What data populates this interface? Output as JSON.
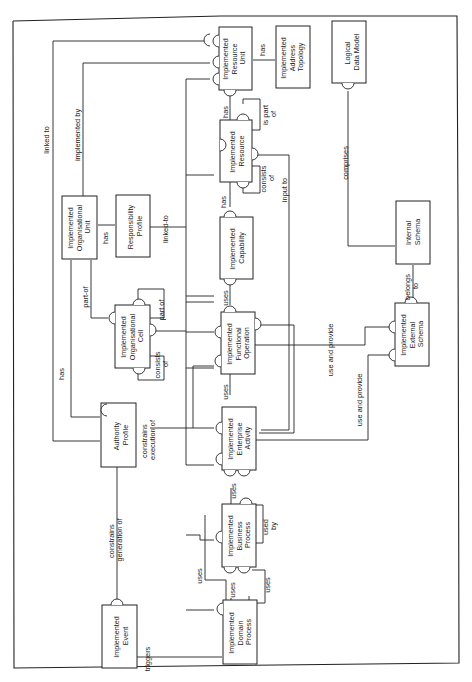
{
  "diagram": {
    "orientation": "rotated 90 degrees counter-clockwise",
    "entities": {
      "resource_unit": [
        "Implemented",
        "Resource",
        "Unit"
      ],
      "address_topology": [
        "Implemented",
        "Address",
        "Topology"
      ],
      "logical_data_model": [
        "Logical",
        "Data Model"
      ],
      "resource": [
        "Implemented",
        "Resource"
      ],
      "capability": [
        "Implemented",
        "Capability"
      ],
      "functional_operation": [
        "Implemented",
        "Functional",
        "Operation"
      ],
      "enterprise_activity": [
        "Implemented",
        "Enterprise",
        "Activity"
      ],
      "business_process": [
        "Implemented",
        "Business",
        "Process"
      ],
      "domain_process": [
        "Implemented",
        "Domain",
        "Process"
      ],
      "org_unit": [
        "Implemented",
        "Organisational",
        "Unit"
      ],
      "responsibility_profile": [
        "Responsibility",
        "Profile"
      ],
      "org_cell": [
        "Implemented",
        "Organisational",
        "Cell"
      ],
      "authority_profile": [
        "Authority",
        "Profile"
      ],
      "event": [
        "Implemented",
        "Event"
      ],
      "internal_schema": [
        "Internal",
        "Schema"
      ],
      "external_schema": [
        "Implemented",
        "External",
        "Schema"
      ]
    },
    "relationships": {
      "linked_to": "linked to",
      "implemented_by": "implemented by",
      "has_resource_unit": "has",
      "has_resource": "has",
      "has_capability": "has",
      "has_responsibility": "has",
      "has_authority": "has",
      "is_part_of": [
        "is part",
        "of"
      ],
      "consists_of_resource": [
        "consists",
        "of"
      ],
      "input_to": "input to",
      "comprises": "comprises",
      "linked_to_responsibility": "linked-to",
      "part_of_unit": "part-of",
      "part_of_cell": "part of",
      "consists_of_cell": [
        "consists",
        "of"
      ],
      "uses_capability": "uses",
      "uses_functional": "uses",
      "uses_enterprise": "uses",
      "uses_business": "uses",
      "uses_domain": "uses",
      "uses_self": "uses",
      "used_by": [
        "used",
        "by"
      ],
      "use_and_provide_1": "use and provide",
      "use_and_provide_2": "use and provide",
      "belongs_to": [
        "belongs",
        "to"
      ],
      "constrains_execution_of": [
        "constrains",
        "execution of"
      ],
      "constrains_generation_of": [
        "constrains",
        "generation of"
      ],
      "triggers": "triggers"
    }
  }
}
